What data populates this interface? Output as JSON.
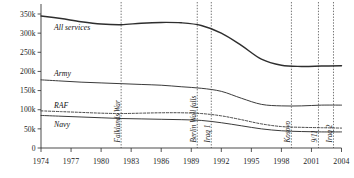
{
  "chart_data": {
    "type": "line",
    "title": "",
    "xlabel": "",
    "ylabel": "",
    "xlim": [
      1974,
      2004
    ],
    "ylim": [
      0,
      350000
    ],
    "grid": false,
    "legend": "inline-labels",
    "y_ticks": [
      0,
      50000,
      100000,
      150000,
      200000,
      250000,
      300000,
      350000
    ],
    "y_tick_labels": [
      "0",
      "50k",
      "100k",
      "150k",
      "200k",
      "250k",
      "300k",
      "350k"
    ],
    "x_ticks": [
      1974,
      1977,
      1980,
      1983,
      1986,
      1989,
      1992,
      1995,
      1998,
      2001,
      2004
    ],
    "x_tick_labels": [
      "1974",
      "1977",
      "1980",
      "1983",
      "1986",
      "1989",
      "1992",
      "1995",
      "1998",
      "2001",
      "2004"
    ],
    "x": [
      1974,
      1976,
      1978,
      1980,
      1982,
      1984,
      1986,
      1988,
      1990,
      1992,
      1994,
      1996,
      1998,
      2000,
      2002,
      2004
    ],
    "series": [
      {
        "name": "All services",
        "style": "solid-thick",
        "values": [
          345000,
          338000,
          330000,
          324000,
          322000,
          326000,
          328000,
          327000,
          320000,
          300000,
          268000,
          232000,
          216000,
          213000,
          214000,
          215000
        ]
      },
      {
        "name": "Army",
        "style": "solid",
        "values": [
          178000,
          175000,
          172000,
          170000,
          168000,
          166000,
          164000,
          160000,
          156000,
          148000,
          130000,
          114000,
          110000,
          110000,
          112000,
          112000
        ]
      },
      {
        "name": "RAF",
        "style": "dashed",
        "values": [
          97000,
          95000,
          93000,
          91000,
          90000,
          91000,
          92000,
          92000,
          90000,
          84000,
          74000,
          63000,
          56000,
          54000,
          53000,
          52000
        ]
      },
      {
        "name": "Navy",
        "style": "solid",
        "values": [
          85000,
          83000,
          81000,
          79000,
          77000,
          76000,
          75000,
          74000,
          72000,
          66000,
          58000,
          50000,
          45000,
          43000,
          42000,
          42000
        ]
      }
    ],
    "series_label_points": [
      {
        "name": "All services",
        "year": 1975.3,
        "value": 307000
      },
      {
        "name": "Army",
        "year": 1975.3,
        "value": 188000
      },
      {
        "name": "RAF",
        "year": 1975.3,
        "value": 105000
      },
      {
        "name": "Navy",
        "year": 1975.3,
        "value": 55000
      }
    ],
    "annotations": [
      {
        "label": "Falklands War",
        "year": 1982
      },
      {
        "label": "Berlin Wall falls",
        "year": 1989.6
      },
      {
        "label": "Iraq 1",
        "year": 1991
      },
      {
        "label": "Kosovo",
        "year": 1999
      },
      {
        "label": "9/11",
        "year": 2001.7
      },
      {
        "label": "Iraq 2",
        "year": 2003.2
      }
    ]
  }
}
